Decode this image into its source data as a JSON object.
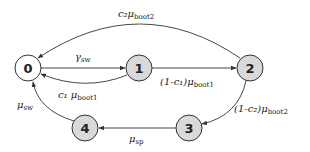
{
  "diagram": {
    "type": "state-transition",
    "colors": {
      "start_fill": "#ffffff",
      "state_fill": "#d9d9d9",
      "stroke": "#333333"
    },
    "nodes": [
      {
        "id": "0",
        "label": "0",
        "x": 28,
        "y": 68,
        "fill": "#ffffff"
      },
      {
        "id": "1",
        "label": "1",
        "x": 139,
        "y": 68,
        "fill": "#d9d9d9"
      },
      {
        "id": "2",
        "label": "2",
        "x": 250,
        "y": 68,
        "fill": "#d9d9d9"
      },
      {
        "id": "3",
        "label": "3",
        "x": 189,
        "y": 128,
        "fill": "#d9d9d9"
      },
      {
        "id": "4",
        "label": "4",
        "x": 85,
        "y": 128,
        "fill": "#d9d9d9"
      }
    ],
    "edges": [
      {
        "from": "0",
        "to": "1",
        "label": "γ_sw",
        "main": "γ",
        "sub": "sw"
      },
      {
        "from": "1",
        "to": "0",
        "label": "c1 μ_boot1",
        "main": "c₁ μ",
        "sub": "boot1"
      },
      {
        "from": "1",
        "to": "2",
        "label": "(1-c1) μ_boot1",
        "main": "(1-c₁)μ",
        "sub": "boot1"
      },
      {
        "from": "2",
        "to": "0",
        "label": "c2 μ_boot2",
        "main": "c₂μ",
        "sub": "boot2"
      },
      {
        "from": "2",
        "to": "3",
        "label": "(1-c2) μ_boot2",
        "main": "(1-c₂)μ",
        "sub": "boot2"
      },
      {
        "from": "3",
        "to": "4",
        "label": "μ_sp",
        "main": "μ",
        "sub": "sp"
      },
      {
        "from": "4",
        "to": "0",
        "label": "μ_sw",
        "main": "μ",
        "sub": "sw"
      }
    ]
  }
}
